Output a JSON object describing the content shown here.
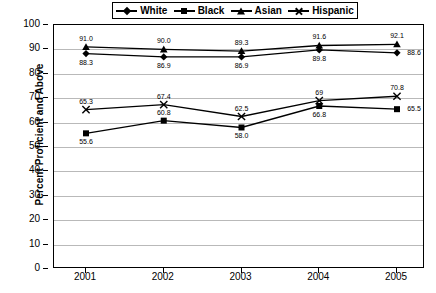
{
  "chart_data": {
    "type": "line",
    "title": "",
    "xlabel": "",
    "ylabel": "Percent Proficient and Above",
    "categories": [
      "2001",
      "2002",
      "2003",
      "2004",
      "2005"
    ],
    "ylim": [
      0,
      100
    ],
    "yticks": [
      0,
      10,
      20,
      30,
      40,
      50,
      60,
      70,
      80,
      90,
      100
    ],
    "grid": "horizontal",
    "legend_position": "top",
    "series": [
      {
        "name": "White",
        "marker": "diamond",
        "values": [
          88.3,
          86.9,
          86.9,
          89.8,
          88.6
        ],
        "labels": [
          "88.3",
          "86.9",
          "86.9",
          "89.8",
          "88.6"
        ],
        "label_pos": [
          "below",
          "below",
          "below",
          "below",
          "right"
        ]
      },
      {
        "name": "Black",
        "marker": "square",
        "values": [
          55.6,
          60.8,
          58.0,
          66.8,
          65.5
        ],
        "labels": [
          "55.6",
          "60.8",
          "58.0",
          "66.8",
          "65.5"
        ],
        "label_pos": [
          "below",
          "above",
          "below",
          "below",
          "right"
        ]
      },
      {
        "name": "Asian",
        "marker": "triangle",
        "values": [
          91.0,
          90.0,
          89.3,
          91.6,
          92.1
        ],
        "labels": [
          "91.0",
          "90.0",
          "89.3",
          "91.6",
          "92.1"
        ],
        "label_pos": [
          "above",
          "above",
          "above",
          "above",
          "above"
        ]
      },
      {
        "name": "Hispanic",
        "marker": "x",
        "values": [
          65.3,
          67.4,
          62.5,
          69.0,
          70.8
        ],
        "labels": [
          "65.3",
          "67.4",
          "62.5",
          "69",
          "70.8"
        ],
        "label_pos": [
          "above",
          "above",
          "above",
          "above",
          "above"
        ]
      }
    ]
  },
  "legend": {
    "items": [
      {
        "label": "White",
        "marker": "diamond-marker-icon"
      },
      {
        "label": "Black",
        "marker": "square-marker-icon"
      },
      {
        "label": "Asian",
        "marker": "triangle-marker-icon"
      },
      {
        "label": "Hispanic",
        "marker": "x-marker-icon"
      }
    ]
  },
  "colors": {
    "series": "#000000",
    "grid": "#b9b9b9",
    "axis": "#000000",
    "background": "#ffffff"
  }
}
